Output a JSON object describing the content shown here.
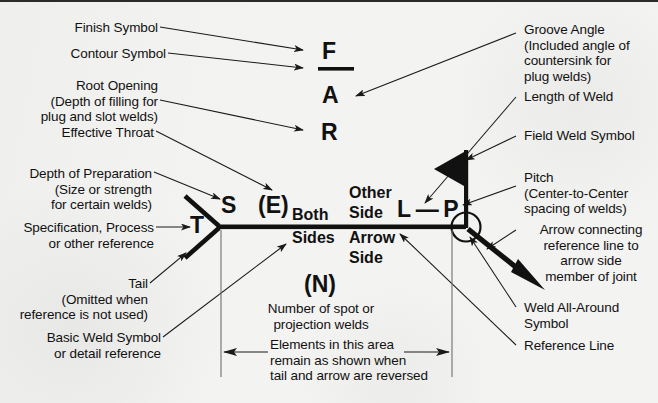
{
  "figure": {
    "background_color": "#f3f3f1",
    "ink_color": "#111111"
  },
  "left_labels": [
    {
      "id": "finish-symbol",
      "text": "Finish Symbol"
    },
    {
      "id": "contour-symbol",
      "text": "Contour Symbol"
    },
    {
      "id": "root-opening",
      "text": "Root Opening\n(Depth of filling for\nplug and slot welds)"
    },
    {
      "id": "effective-throat",
      "text": "Effective Throat"
    },
    {
      "id": "depth-of-preparation",
      "text": "Depth of Preparation\n(Size or strength\nfor certain welds)"
    },
    {
      "id": "specification-process",
      "text": "Specification, Process\nor other reference"
    },
    {
      "id": "tail",
      "text": "Tail\n(Omitted when\nreference is not used)"
    },
    {
      "id": "basic-weld-symbol",
      "text": "Basic Weld Symbol\nor detail reference"
    }
  ],
  "right_labels": [
    {
      "id": "groove-angle",
      "text": "Groove Angle\n(Included angle of\ncountersink for\nplug welds)"
    },
    {
      "id": "length-of-weld",
      "text": "Length of Weld"
    },
    {
      "id": "field-weld-symbol",
      "text": "Field Weld Symbol"
    },
    {
      "id": "pitch",
      "text": "Pitch\n(Center-to-Center\nspacing of welds)"
    },
    {
      "id": "arrow-connecting",
      "text": "Arrow connecting\nreference line to\narrow side\nmember of joint"
    },
    {
      "id": "weld-all-around",
      "text": "Weld All-Around\nSymbol"
    },
    {
      "id": "reference-line",
      "text": "Reference Line"
    }
  ],
  "symbols": {
    "finish": "F",
    "groove_angle": "A",
    "root_opening": "R",
    "depth_of_preparation": "S",
    "effective_throat": "(E)",
    "specification": "T",
    "length_pitch": "L — P",
    "number_of_welds": "(N)"
  },
  "center_text": {
    "both_sides_line1": "Both",
    "both_sides_line2": "Sides",
    "other_side_line1": "Other",
    "other_side_line2": "Side",
    "arrow_side_line1": "Arrow",
    "arrow_side_line2": "Side"
  },
  "bottom_notes": {
    "number_of_welds_note": "Number of spot or\nprojection welds",
    "reversed_note": "Elements in this area\nremain as shown when\ntail and arrow are reversed"
  }
}
